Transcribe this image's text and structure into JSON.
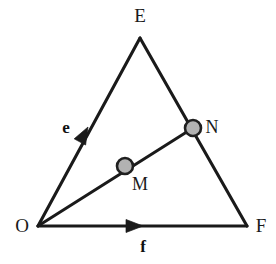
{
  "figure": {
    "type": "geometry-vector-diagram",
    "background_color": "#ffffff",
    "stroke_color": "#1a1a1a",
    "node_fill_color": "#b2b2b2",
    "node_stroke_color": "#1f1f1f",
    "width": 276,
    "height": 264
  },
  "vertices": {
    "origin": {
      "label": "O",
      "x": 38,
      "y": 226,
      "label_x": 22,
      "label_y": 232
    },
    "apex": {
      "label": "E",
      "x": 140,
      "y": 38,
      "label_x": 140,
      "label_y": 22
    },
    "right": {
      "label": "F",
      "x": 247,
      "y": 226,
      "label_x": 261,
      "label_y": 232
    }
  },
  "nodes": [
    {
      "label": "M",
      "x": 125,
      "y": 166,
      "radius": 8,
      "label_x": 140,
      "label_y": 190
    },
    {
      "label": "N",
      "x": 193,
      "y": 128,
      "radius": 8,
      "label_x": 212,
      "label_y": 133
    }
  ],
  "vectors": [
    {
      "label": "e",
      "from": "O",
      "to": "E",
      "label_x": 66,
      "label_y": 133,
      "arrow_x": 88,
      "arrow_y": 127
    },
    {
      "label": "f",
      "from": "O",
      "to": "F",
      "label_x": 143,
      "label_y": 252,
      "arrow_x": 143,
      "arrow_y": 226
    }
  ],
  "segments": [
    {
      "name": "edge-O-E",
      "from": "O",
      "to": "E"
    },
    {
      "name": "edge-E-F",
      "from": "E",
      "to": "F"
    },
    {
      "name": "edge-O-F",
      "from": "O",
      "to": "F"
    },
    {
      "name": "ray-O-N",
      "from": "O",
      "to": "N"
    }
  ]
}
